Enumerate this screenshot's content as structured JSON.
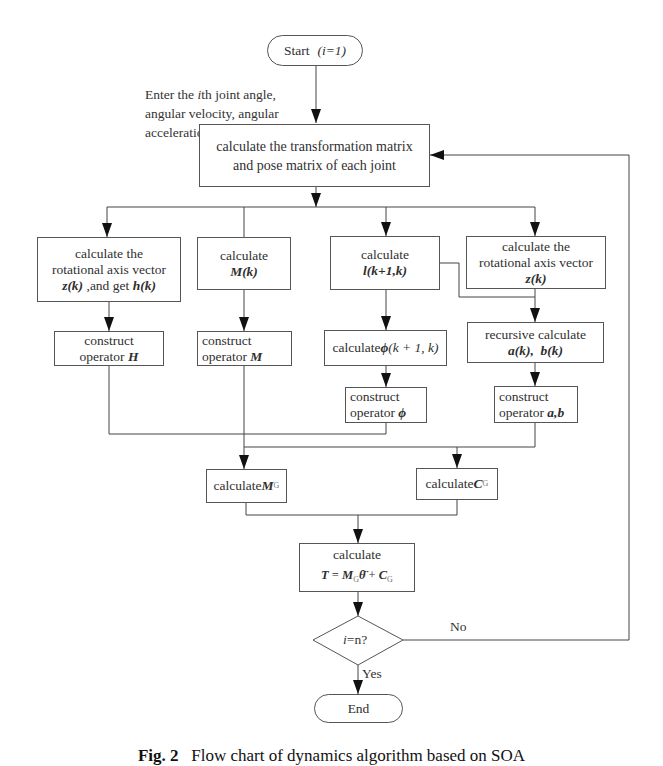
{
  "diagram": {
    "type": "flowchart",
    "start": {
      "label": "Start",
      "param": "i=1"
    },
    "input_note": {
      "line1_pre": "Enter the ",
      "line1_var": "i",
      "line1_post": "th joint angle,",
      "line2": "angular velocity, angular",
      "line3_pre": "acceleration ",
      "line3_vars": "θ,  θ̇,  θ̈"
    },
    "transform": {
      "line1": "calculate the transformation matrix",
      "line2": "and pose matrix of each joint"
    },
    "branch_z_h": {
      "line1": "calculate the",
      "line2": "rotational axis vector",
      "line3_a": "z(k)",
      "line3_b": " ,and get ",
      "line3_c": "h(k)"
    },
    "branch_m": {
      "line1": "calculate",
      "line2": "M(k)"
    },
    "branch_l": {
      "line1": "calculate",
      "line2": "l(k+1,k)"
    },
    "branch_z": {
      "line1": "calculate the",
      "line2": "rotational axis vector",
      "line3": "z(k)"
    },
    "construct_h": {
      "line1": "construct",
      "line2_a": "operator ",
      "line2_b": "H"
    },
    "construct_m": {
      "line1": "construct",
      "line2_a": "operator ",
      "line2_b": "M"
    },
    "calc_phi": {
      "text_a": "calculate ",
      "text_b": "ϕ",
      "text_c": "(k + 1, k)"
    },
    "construct_phi": {
      "line1": "construct",
      "line2_a": "operator ",
      "line2_b": "ϕ"
    },
    "recursive": {
      "line1": "recursive calculate",
      "line2_a": "a(k),",
      "line2_b": "b(k)"
    },
    "construct_ab": {
      "line1": "construct",
      "line2_a": "operator ",
      "line2_b": "a,b"
    },
    "calc_mg": {
      "text": "calculate",
      "var": "M",
      "sub": "G"
    },
    "calc_cg": {
      "text": "calculate",
      "var": "C",
      "sub": "G"
    },
    "calc_t": {
      "line1": "calculate",
      "T": "T",
      "eq": " = ",
      "M": "M",
      "M_sub": "G",
      "theta": "θ̈",
      "plus": " + ",
      "C": "C",
      "C_sub": "G"
    },
    "decision": {
      "var": "i",
      "rest": "=n?"
    },
    "edge_no": "No",
    "edge_yes": "Yes",
    "end": {
      "label": "End"
    }
  },
  "caption": {
    "fig": "Fig. 2",
    "text": "Flow chart of dynamics algorithm based on SOA"
  },
  "colors": {
    "line": "#444444",
    "border": "#555555",
    "text": "#2f2f2f",
    "background": "#ffffff"
  }
}
